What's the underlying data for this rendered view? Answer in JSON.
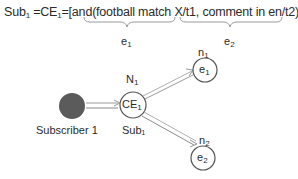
{
  "formula": {
    "prefix": "Sub",
    "prefix_sub": "1",
    "eq1": " =CE",
    "eq1_sub": "1",
    "rest_start": "=[and(",
    "part1": "football match X/t1",
    "sep": ", ",
    "part2": "comment in en/t2",
    "rest_end": ")]"
  },
  "braces": [
    {
      "label": "e",
      "label_sub": "1"
    },
    {
      "label": "e",
      "label_sub": "2"
    }
  ],
  "nodes": {
    "subscriber": {
      "label": "Subscriber 1",
      "color": "#5b5b5b"
    },
    "ce": {
      "text": "CE",
      "text_sub": "1",
      "top_label": "N",
      "top_label_sub": "1",
      "bottom_label": "Sub₁"
    },
    "e1": {
      "text": "e",
      "text_sub": "1",
      "top_label": "n",
      "top_label_sub": "1"
    },
    "e2": {
      "text": "e",
      "text_sub": "2",
      "top_label": "n",
      "top_label_sub": "2"
    }
  },
  "colors": {
    "stroke": "#555555",
    "arrow": "#8a8a8a",
    "text": "#2b2b2b"
  }
}
